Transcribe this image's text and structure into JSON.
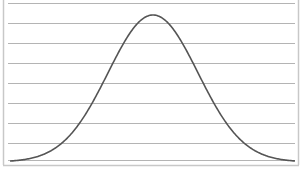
{
  "chart_data": {
    "type": "line",
    "title": "",
    "xlabel": "",
    "ylabel": "",
    "grid": {
      "horizontal": true,
      "vertical": false,
      "count": 8
    },
    "legend": null,
    "xlim": [
      -3.4,
      3.4
    ],
    "ylim": [
      0,
      1.08
    ],
    "series": [
      {
        "name": "normal curve",
        "color": "#555555",
        "mean": 0,
        "sd": 1,
        "x": [
          -3.2,
          -2.8,
          -2.4,
          -2.0,
          -1.6,
          -1.2,
          -0.8,
          -0.4,
          0.0,
          0.4,
          0.8,
          1.2,
          1.6,
          2.0,
          2.4,
          2.8,
          3.2
        ],
        "values": [
          0.006,
          0.02,
          0.056,
          0.135,
          0.278,
          0.487,
          0.726,
          0.923,
          1.0,
          0.923,
          0.726,
          0.487,
          0.278,
          0.135,
          0.056,
          0.02,
          0.006
        ]
      }
    ]
  },
  "colors": {
    "background": "#ffffff",
    "gridline": "#b4b4b4",
    "border": "#c8c8c8",
    "curve": "#555555"
  }
}
